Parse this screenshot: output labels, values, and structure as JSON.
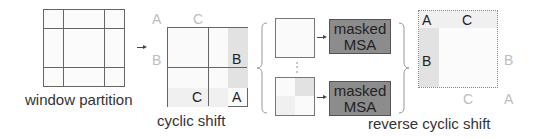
{
  "captions": {
    "window_partition": "window partition",
    "cyclic_shift": "cyclic shift",
    "reverse_cyclic_shift": "reverse cyclic shift"
  },
  "cyclic_shift_grid": {
    "outside_labels": {
      "a": "A",
      "c": "C",
      "b": "B"
    },
    "inside_labels": {
      "b": "B",
      "c": "C",
      "a": "A"
    }
  },
  "msa_blocks": [
    {
      "line1": "masked",
      "line2": "MSA"
    },
    {
      "line1": "masked",
      "line2": "MSA"
    }
  ],
  "ellipsis": "⋮",
  "reverse_grid": {
    "inside_labels": {
      "a": "A",
      "c": "C",
      "b": "B"
    },
    "outside_labels": {
      "b": "B",
      "c": "C",
      "a": "A"
    }
  },
  "colors": {
    "msa_fill": "#8c8c8c",
    "shade": "#e2e2e2",
    "faint_label": "#bdbdbd",
    "grid_line": "#666666"
  }
}
